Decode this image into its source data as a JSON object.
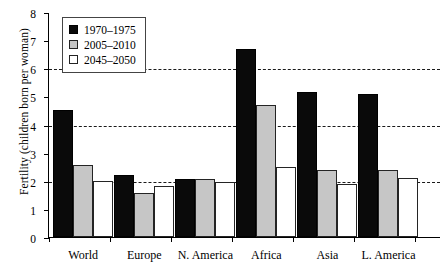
{
  "chart_data": {
    "type": "bar",
    "title": "",
    "xlabel": "",
    "ylabel": "Fertility (children born per woman)",
    "ylim": [
      0,
      8
    ],
    "yticks": [
      0,
      1,
      2,
      3,
      4,
      5,
      6,
      7,
      8
    ],
    "gridlines": [
      2,
      4,
      6
    ],
    "grid": true,
    "legend_position": "top-left",
    "categories": [
      "World",
      "Europe",
      "N. America",
      "Africa",
      "Asia",
      "L. America"
    ],
    "series": [
      {
        "name": "1970–1975",
        "color": "#0a0a0a",
        "values": [
          4.5,
          2.2,
          2.05,
          6.7,
          5.15,
          5.1
        ]
      },
      {
        "name": "2005–2010",
        "color": "#c6c6c6",
        "values": [
          2.55,
          1.55,
          2.05,
          4.7,
          2.4,
          2.4
        ]
      },
      {
        "name": "2045–2050",
        "color": "#ffffff",
        "values": [
          2.0,
          1.8,
          1.95,
          2.5,
          1.9,
          2.1
        ]
      }
    ]
  }
}
